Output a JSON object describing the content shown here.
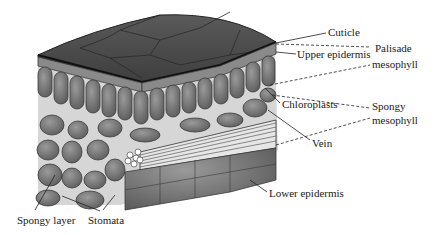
{
  "diagram": {
    "labels": {
      "cuticle": "Cuticle",
      "upper_epidermis": "Upper epidermis",
      "palisade_line1": "Palisade",
      "palisade_line2": "mesophyll",
      "chloroplasts": "Chloroplasts",
      "spongy_line1": "Spongy",
      "spongy_line2": "mesophyll",
      "vein": "Vein",
      "lower_epidermis": "Lower epidermis",
      "spongy_layer": "Spongy layer",
      "stomata": "Stomata"
    },
    "colors": {
      "cuticle_top": "#4a4a4a",
      "cell_fill": "#7a7a7a",
      "cell_stroke": "#3a3a3a",
      "air_space": "#d8d8d8",
      "vein_fill": "#e8e8e8",
      "label_text": "#1a1a1a"
    }
  }
}
